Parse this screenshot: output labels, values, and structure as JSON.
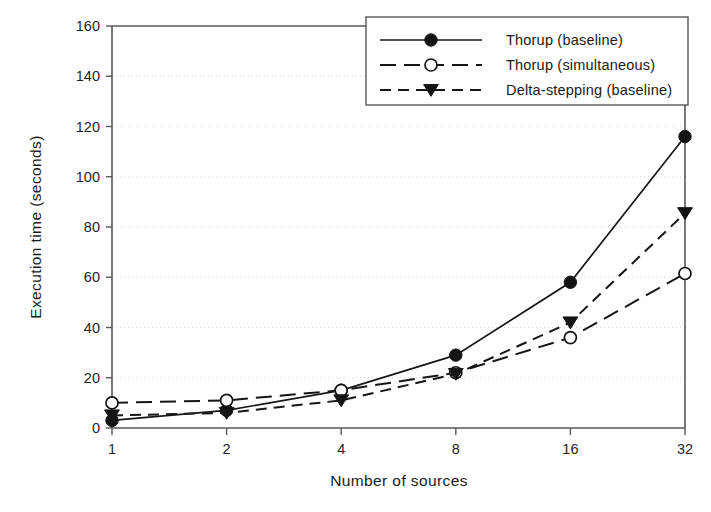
{
  "chart_data": {
    "type": "line",
    "title": "",
    "xlabel": "Number of sources",
    "ylabel": "Execution time (seconds)",
    "x": [
      1,
      2,
      4,
      8,
      16,
      32
    ],
    "xtick_labels": [
      "1",
      "2",
      "4",
      "8",
      "16",
      "32"
    ],
    "ytick_labels": [
      "0",
      "20",
      "40",
      "60",
      "80",
      "100",
      "120",
      "140",
      "160"
    ],
    "yticks": [
      0,
      20,
      40,
      60,
      80,
      100,
      120,
      140,
      160
    ],
    "ylim": [
      0,
      160
    ],
    "xscale": "log2",
    "grid": "horizontal-dotted",
    "legend_position": "upper-right",
    "series": [
      {
        "name": "Thorup (baseline)",
        "marker": "filled-circle",
        "linestyle": "solid",
        "values": [
          3,
          7,
          15,
          29,
          58,
          116
        ]
      },
      {
        "name": "Thorup (simultaneous)",
        "marker": "open-circle",
        "linestyle": "long-dash",
        "values": [
          10,
          11,
          15,
          22,
          36,
          61.5
        ]
      },
      {
        "name": "Delta-stepping (baseline)",
        "marker": "filled-triangle-down",
        "linestyle": "dashed",
        "values": [
          5,
          6,
          11,
          21.5,
          42,
          85.5
        ]
      }
    ]
  },
  "axes": {
    "y_title": "Execution time (seconds)",
    "x_title": "Number of sources",
    "y_ticks": [
      "160",
      "140",
      "120",
      "100",
      "80",
      "60",
      "40",
      "20",
      "0"
    ],
    "x_ticks": [
      "1",
      "2",
      "4",
      "8",
      "16",
      "32"
    ]
  },
  "legend": {
    "entries": [
      {
        "label": "Thorup (baseline)"
      },
      {
        "label": "Thorup (simultaneous)"
      },
      {
        "label": "Delta-stepping (baseline)"
      }
    ]
  },
  "colors": {
    "ink": "#161616",
    "axis": "#575757",
    "grid": "#d2d2d2",
    "background": "#ffffff"
  }
}
